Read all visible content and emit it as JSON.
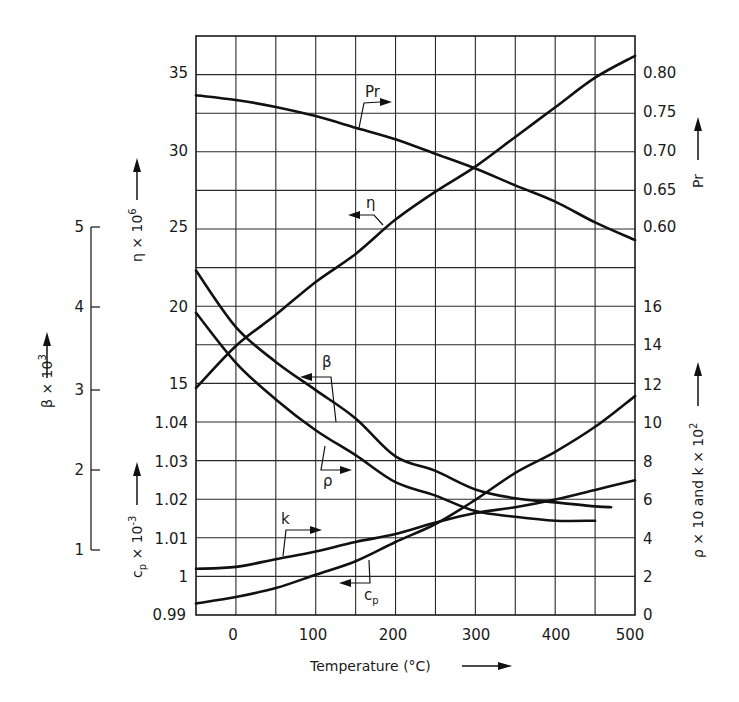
{
  "chart_data": {
    "type": "line",
    "title": "",
    "xlabel": "Temperature (°C)",
    "x_ticks": [
      0,
      100,
      200,
      300,
      400,
      500
    ],
    "xlim": [
      -50,
      500
    ],
    "grid": true,
    "axes": {
      "eta": {
        "label": "η × 10⁶",
        "ticks": [
          "35",
          "30",
          "25",
          "20",
          "15"
        ],
        "side": "left"
      },
      "cp": {
        "label": "cp × 10⁻³",
        "ticks": [
          "1.04",
          "1.03",
          "1.02",
          "1.01",
          "1",
          "0.99"
        ],
        "side": "left"
      },
      "beta": {
        "label": "β × 10³",
        "ticks": [
          "5",
          "4",
          "3",
          "2",
          "1"
        ],
        "side": "far-left"
      },
      "Pr": {
        "label": "Pr",
        "ticks": [
          "0.80",
          "0.75",
          "0.70",
          "0.65",
          "0.60"
        ],
        "side": "right"
      },
      "rho_k": {
        "label": "ρ × 10 and k × 10²",
        "ticks": [
          "16",
          "14",
          "12",
          "10",
          "8",
          "6",
          "4",
          "2",
          "0"
        ],
        "side": "right"
      }
    },
    "series": [
      {
        "name": "Pr",
        "axis": "Pr",
        "x": [
          -50,
          0,
          50,
          100,
          150,
          200,
          250,
          300,
          350,
          400,
          450,
          500
        ],
        "values": [
          0.771,
          0.765,
          0.756,
          0.744,
          0.729,
          0.714,
          0.695,
          0.676,
          0.654,
          0.633,
          0.606,
          0.583
        ]
      },
      {
        "name": "η",
        "axis": "eta",
        "x": [
          -50,
          0,
          50,
          100,
          150,
          200,
          250,
          300,
          350,
          400,
          450,
          500
        ],
        "values": [
          14.8,
          17.5,
          19.5,
          21.6,
          23.4,
          25.6,
          27.4,
          29.0,
          30.9,
          32.8,
          34.7,
          36.1
        ]
      },
      {
        "name": "β",
        "axis": "beta",
        "x": [
          -50,
          0,
          50,
          100,
          150,
          200,
          250,
          300,
          350,
          400,
          450,
          470
        ],
        "values": [
          4.46,
          3.76,
          3.33,
          2.98,
          2.63,
          2.16,
          1.98,
          1.75,
          1.64,
          1.59,
          1.54,
          1.53
        ]
      },
      {
        "name": "ρ",
        "axis": "rho_k",
        "x": [
          -50,
          0,
          50,
          100,
          150,
          200,
          250,
          300,
          350,
          400,
          450
        ],
        "values": [
          15.7,
          13.1,
          11.2,
          9.6,
          8.3,
          6.9,
          6.2,
          5.4,
          5.1,
          4.9,
          4.9
        ]
      },
      {
        "name": "k",
        "axis": "rho_k",
        "x": [
          -50,
          0,
          50,
          100,
          150,
          200,
          250,
          300,
          350,
          400,
          450,
          500
        ],
        "values": [
          2.4,
          2.5,
          2.9,
          3.3,
          3.8,
          4.2,
          4.8,
          5.3,
          5.6,
          6.0,
          6.5,
          7.0
        ]
      },
      {
        "name": "cp",
        "axis": "cp",
        "x": [
          -50,
          0,
          50,
          100,
          150,
          200,
          250,
          300,
          350,
          400,
          450,
          500
        ],
        "values": [
          0.993,
          0.9947,
          0.997,
          1.0005,
          1.004,
          1.009,
          1.0137,
          1.02,
          1.027,
          1.0325,
          1.039,
          1.047
        ]
      }
    ],
    "curve_labels": [
      "Pr",
      "η",
      "β",
      "ρ",
      "k",
      "cp"
    ]
  },
  "labels": {
    "xlabel": "Temperature (°C)",
    "eta_axis": "η × 10",
    "eta_sup": "6",
    "cp_axis": "c",
    "cp_sub": "p",
    "cp_rest": " × 10",
    "cp_sup": "-3",
    "beta_axis": "β × 10",
    "beta_sup": "3",
    "pr_axis": "Pr",
    "rhok_axis": "ρ × 10  and  k × 10",
    "rhok_sup": "2",
    "curve_pr": "Pr",
    "curve_eta": "η",
    "curve_beta": "β",
    "curve_rho": "ρ",
    "curve_k": "k",
    "curve_cp": "c",
    "curve_cp_sub": "p"
  },
  "ticks": {
    "x": [
      "0",
      "100",
      "200",
      "300",
      "400",
      "500"
    ],
    "eta": [
      "35",
      "30",
      "25",
      "20",
      "15"
    ],
    "cp": [
      "1.04",
      "1.03",
      "1.02",
      "1.01",
      "1",
      "0.99"
    ],
    "beta": [
      "5",
      "4",
      "3",
      "2",
      "1"
    ],
    "pr": [
      "0.80",
      "0.75",
      "0.70",
      "0.65",
      "0.60"
    ],
    "rhok": [
      "16",
      "14",
      "12",
      "10",
      "8",
      "6",
      "4",
      "2",
      "0"
    ]
  }
}
